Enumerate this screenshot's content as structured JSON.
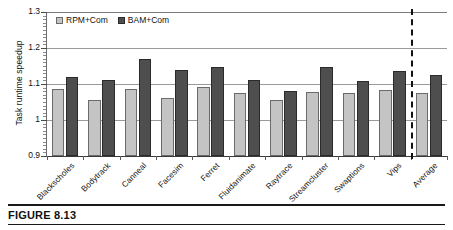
{
  "figure": {
    "caption": "FIGURE 8.13"
  },
  "chart_data": {
    "type": "bar",
    "title": "",
    "xlabel": "",
    "ylabel": "Task runtime speedup",
    "ylim": [
      0.9,
      1.3
    ],
    "ytick_labels": [
      "0.9",
      "1",
      "1.1",
      "1.2",
      "1.3"
    ],
    "ytick_values": [
      0.9,
      1.0,
      1.1,
      1.2,
      1.3
    ],
    "grid": true,
    "legend_position": "top-left",
    "categories": [
      "Blackscholes",
      "Bodytrack",
      "Canneal",
      "Facesim",
      "Ferret",
      "Fluidanimate",
      "Raytrace",
      "Streamcluster",
      "Swaptions",
      "Vips",
      "Average"
    ],
    "series": [
      {
        "name": "RPM+Com",
        "color": "#c4c4c4",
        "values": [
          1.085,
          1.055,
          1.085,
          1.062,
          1.092,
          1.075,
          1.055,
          1.078,
          1.076,
          1.082,
          1.076
        ]
      },
      {
        "name": "BAM+Com",
        "color": "#4e4e4e",
        "values": [
          1.12,
          1.111,
          1.17,
          1.14,
          1.148,
          1.112,
          1.08,
          1.148,
          1.108,
          1.136,
          1.126
        ]
      }
    ],
    "annotations": [
      {
        "type": "vertical-dashed-line",
        "before_category": "Average"
      }
    ]
  }
}
